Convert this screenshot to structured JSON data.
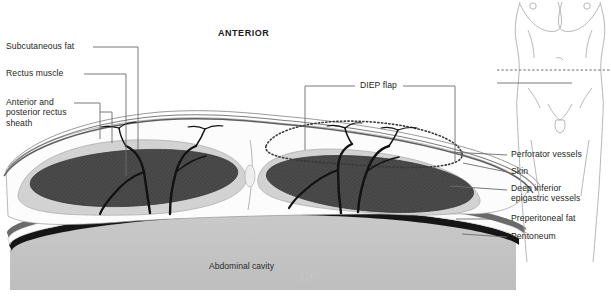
{
  "figure": {
    "title": "ANTERIOR",
    "signature": "Cr.",
    "cavity_label": "Abdominal cavity",
    "type": "anatomical-cross-section"
  },
  "labels_left": [
    {
      "id": "subcutaneous-fat",
      "text": "Subcutaneous fat"
    },
    {
      "id": "rectus-muscle",
      "text": "Rectus muscle"
    },
    {
      "id": "rectus-sheath",
      "text": "Anterior and\nposterior rectus\nsheath"
    }
  ],
  "labels_top": [
    {
      "id": "diep-flap",
      "text": "DIEP flap"
    }
  ],
  "labels_right": [
    {
      "id": "perforator-vessels",
      "text": "Perforator vessels"
    },
    {
      "id": "skin",
      "text": "Skin"
    },
    {
      "id": "deep-inferior-epigastric-vessels",
      "text": "Deep inferior\nepigastric vessels"
    },
    {
      "id": "preperitoneal-fat",
      "text": "Preperitoneal fat"
    },
    {
      "id": "peritoneum",
      "text": "Peritoneum"
    }
  ],
  "inset": {
    "id": "torso-diagram",
    "description": "female torso with section level line"
  },
  "colors": {
    "muscle": "#4a4a4a",
    "sheath": "#cfcfcf",
    "fat": "#fafafa",
    "cavity": "#c4c4c4",
    "peritoneum": "#1a1a1a",
    "skin_line": "#6e6e6e",
    "vessel": "#111111",
    "text": "#231f20",
    "leader": "#6b6b6b",
    "inset_line": "#a9a9b4"
  }
}
